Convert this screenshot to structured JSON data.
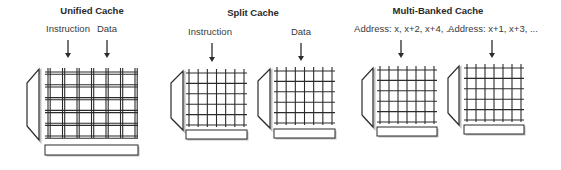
{
  "sections": [
    {
      "title": "Unified Cache",
      "title_x": 92,
      "title_y": 11,
      "labels": [
        {
          "text": "Instruction",
          "x": 68,
          "y": 29
        },
        {
          "text": "Data",
          "x": 107,
          "y": 29
        }
      ],
      "arrows": [
        {
          "x": 68,
          "y1": 40,
          "y2": 58
        },
        {
          "x": 107,
          "y1": 40,
          "y2": 58
        }
      ],
      "banks": [
        {
          "decoder": {
            "x1": 27,
            "x2": 39,
            "top": 69,
            "bottom": 140,
            "inset": 14
          },
          "grid": {
            "x": 45,
            "y": 68,
            "w": 93,
            "h": 70,
            "cols": 7,
            "rows": 6,
            "doubled": true
          },
          "bar": {
            "x": 45,
            "y": 145,
            "w": 93,
            "h": 10
          }
        }
      ]
    },
    {
      "title": "Split Cache",
      "title_x": 253,
      "title_y": 13,
      "labels": [
        {
          "text": "Instruction",
          "x": 210,
          "y": 32
        },
        {
          "text": "Data",
          "x": 301,
          "y": 32
        }
      ],
      "arrows": [
        {
          "x": 212,
          "y1": 43,
          "y2": 62
        },
        {
          "x": 301,
          "y1": 43,
          "y2": 61
        }
      ],
      "banks": [
        {
          "decoder": {
            "x1": 171,
            "x2": 183,
            "top": 71,
            "bottom": 130,
            "inset": 12
          },
          "grid": {
            "x": 186,
            "y": 69,
            "w": 61,
            "h": 58,
            "cols": 7,
            "rows": 6,
            "doubled": false
          },
          "bar": {
            "x": 186,
            "y": 130,
            "w": 61,
            "h": 9
          }
        },
        {
          "decoder": {
            "x1": 258,
            "x2": 270,
            "top": 69,
            "bottom": 128,
            "inset": 12
          },
          "grid": {
            "x": 274,
            "y": 67,
            "w": 61,
            "h": 58,
            "cols": 7,
            "rows": 6,
            "doubled": false
          },
          "bar": {
            "x": 274,
            "y": 129,
            "w": 61,
            "h": 9
          }
        }
      ]
    },
    {
      "title": "Multi-Banked Cache",
      "title_x": 438,
      "title_y": 11,
      "labels": [
        {
          "text": "Address: x, x+2, x+4, ...",
          "x": 404,
          "y": 29
        },
        {
          "text": "Address: x+1, x+3, ...",
          "x": 493,
          "y": 29
        }
      ],
      "arrows": [
        {
          "x": 401,
          "y1": 40,
          "y2": 58
        },
        {
          "x": 492,
          "y1": 40,
          "y2": 58
        }
      ],
      "banks": [
        {
          "decoder": {
            "x1": 362,
            "x2": 373,
            "top": 68,
            "bottom": 127,
            "inset": 12
          },
          "grid": {
            "x": 377,
            "y": 66,
            "w": 60,
            "h": 58,
            "cols": 7,
            "rows": 6,
            "doubled": false
          },
          "bar": {
            "x": 377,
            "y": 127,
            "w": 60,
            "h": 9
          }
        },
        {
          "decoder": {
            "x1": 448,
            "x2": 459,
            "top": 66,
            "bottom": 125,
            "inset": 12
          },
          "grid": {
            "x": 464,
            "y": 64,
            "w": 60,
            "h": 58,
            "cols": 7,
            "rows": 6,
            "doubled": false
          },
          "bar": {
            "x": 464,
            "y": 125,
            "w": 60,
            "h": 9
          }
        }
      ]
    }
  ],
  "colors": {
    "line": "#2b2b2b",
    "bar_fill": "#ffffff",
    "shadow": "#bdbdbd",
    "text": "#333333"
  }
}
